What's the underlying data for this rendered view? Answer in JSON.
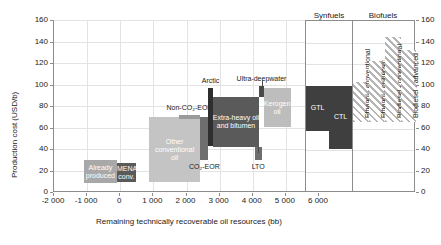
{
  "chart_data": {
    "type": "bar",
    "title": "",
    "panels": [
      {
        "name": "oil-resources-panel",
        "xlabel": "Remaining technically recoverable oil resources (bb)",
        "ylabel": "Production cost (USD/b)",
        "xlim": [
          -2000,
          6000
        ],
        "ylim": [
          0,
          160
        ],
        "xticks": [
          "-2 000",
          "-1 000",
          "0",
          "1 000",
          "2 000",
          "3 000",
          "4 000",
          "5 000",
          "6 000"
        ],
        "xtick_values": [
          -2000,
          -1000,
          0,
          1000,
          2000,
          3000,
          4000,
          5000,
          6000
        ],
        "yticks": [
          "0",
          "20",
          "40",
          "60",
          "80",
          "100",
          "120",
          "140",
          "160"
        ],
        "ytick_values": [
          0,
          20,
          40,
          60,
          80,
          100,
          120,
          140,
          160
        ],
        "grid": true,
        "bars": [
          {
            "label": "Already\nproduced",
            "x0": -1100,
            "x1": -100,
            "y0": 8,
            "y1": 30,
            "color": "#a8a8a8",
            "label_pos": "inside",
            "label_color": "light"
          },
          {
            "label": "MENA\nconv. oil",
            "x0": -100,
            "x1": 470,
            "y0": 9,
            "y1": 27,
            "color": "#5a5a5a",
            "label_pos": "inside",
            "label_color": "light"
          },
          {
            "label": "Other\nconventional\noil",
            "x0": 860,
            "x1": 2420,
            "y0": 9,
            "y1": 70,
            "color": "#c4c4c4",
            "label_pos": "inside",
            "label_color": "light"
          },
          {
            "label": "CO₂-EOR",
            "x0": 2420,
            "x1": 2660,
            "y0": 30,
            "y1": 70,
            "color": "#6e6e6e",
            "label_pos": "below",
            "label_color": "dark"
          },
          {
            "label": "Non-CO₂-EOR",
            "x0": 1760,
            "x1": 2420,
            "y0": 68,
            "y1": 72,
            "color": "#9a9a9a",
            "label_pos": "above",
            "label_color": "dark"
          },
          {
            "label": "Arctic",
            "x0": 2660,
            "x1": 2790,
            "y0": 43,
            "y1": 97,
            "color": "#2e2e2e",
            "label_pos": "above",
            "label_color": "dark"
          },
          {
            "label": "Extra-heavy oil\nand bitumen",
            "x0": 2790,
            "x1": 4200,
            "y0": 42,
            "y1": 88,
            "color": "#5a5a5a",
            "label_pos": "inside",
            "label_color": "light"
          },
          {
            "label": "LTO",
            "x0": 4060,
            "x1": 4270,
            "y0": 30,
            "y1": 42,
            "color": "#6e6e6e",
            "label_pos": "below",
            "label_color": "dark"
          },
          {
            "label": "Ultra-deepwater",
            "x0": 4200,
            "x1": 4330,
            "y0": 88,
            "y1": 99,
            "color": "#4a4a4a",
            "label_pos": "above",
            "label_color": "dark"
          },
          {
            "label": "Kerogen\noil",
            "x0": 4330,
            "x1": 5140,
            "y0": 60,
            "y1": 97,
            "color": "#bdbdbd",
            "label_pos": "inside",
            "label_color": "light"
          }
        ]
      },
      {
        "name": "alternative-fuels-panel",
        "ylim": [
          0,
          160
        ],
        "yticks": [
          "0",
          "20",
          "40",
          "60",
          "80",
          "100",
          "120",
          "140",
          "160"
        ],
        "ytick_values": [
          0,
          20,
          40,
          60,
          80,
          100,
          120,
          140,
          160
        ],
        "groups": [
          {
            "label": "Synfuels"
          },
          {
            "label": "Biofuels"
          }
        ],
        "bars": [
          {
            "label": "GTL",
            "slot": 0,
            "y0": 58,
            "y1": 100,
            "color": "#3f3f3f",
            "fill": "solid",
            "label_pos": "inside",
            "label_color": "light",
            "orient": "h"
          },
          {
            "label": "CTL",
            "slot": 1,
            "y0": 41,
            "y1": 100,
            "color": "#3f3f3f",
            "fill": "solid",
            "label_pos": "inside",
            "label_color": "light",
            "orient": "h"
          },
          {
            "label": "Ethanol - conventional",
            "slot": 2,
            "y0": 66,
            "y1": 103,
            "color": "#b5b5b5",
            "fill": "hatch",
            "label_pos": "rotated",
            "label_color": "dark",
            "orient": "v"
          },
          {
            "label": "Ethanol - cellulosic",
            "slot": 3,
            "y0": 66,
            "y1": 123,
            "color": "#b5b5b5",
            "fill": "hatch",
            "label_pos": "rotated",
            "label_color": "dark",
            "orient": "v"
          },
          {
            "label": "Biodiesel - conventional",
            "slot": 4,
            "y0": 66,
            "y1": 145,
            "color": "#b5b5b5",
            "fill": "hatch",
            "label_pos": "rotated",
            "label_color": "dark",
            "orient": "v"
          },
          {
            "label": "Biodiesel - advanced",
            "slot": 5,
            "y0": 66,
            "y1": 133,
            "color": "#b5b5b5",
            "fill": "hatch",
            "label_pos": "rotated",
            "label_color": "dark",
            "orient": "v"
          }
        ]
      }
    ]
  },
  "left_panel": {
    "y_axis_title": "Production cost (USD/b)",
    "x_axis_title": "Remaining technically recoverable oil resources (bb)",
    "yticks": [
      "160",
      "140",
      "120",
      "100",
      "80",
      "60",
      "40",
      "20",
      "0"
    ],
    "xticks": [
      "-2 000",
      "-1 000",
      "0",
      "1 000",
      "2 000",
      "3 000",
      "4 000",
      "5 000",
      "6 000"
    ],
    "bars": {
      "already_produced": "Already\nproduced",
      "mena_conv_oil": "MENA\nconv. oil",
      "other_conventional_oil": "Other\nconventional\noil",
      "co2_eor": "CO₂-EOR",
      "non_co2_eor": "Non-CO₂-EOR",
      "arctic": "Arctic",
      "extra_heavy": "Extra-heavy oil\nand bitumen",
      "lto": "LTO",
      "ultra_deepwater": "Ultra-deepwater",
      "kerogen_oil": "Kerogen\noil"
    }
  },
  "right_panel": {
    "group_synfuels": "Synfuels",
    "group_biofuels": "Biofuels",
    "yticks": [
      "160",
      "140",
      "120",
      "100",
      "80",
      "60",
      "40",
      "20",
      "0"
    ],
    "bars": {
      "gtl": "GTL",
      "ctl": "CTL",
      "ethanol_conventional": "Ethanol - conventional",
      "ethanol_cellulosic": "Ethanol - cellulosic",
      "biodiesel_conventional": "Biodiesel - conventional",
      "biodiesel_advanced": "Biodiesel - advanced"
    }
  }
}
